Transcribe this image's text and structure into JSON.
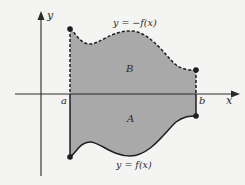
{
  "figure": {
    "axes": {
      "x_label": "x",
      "y_label": "y"
    },
    "bounds": {
      "left_label": "a",
      "right_label": "b"
    },
    "curves": {
      "upper_label": "y = −f(x)",
      "lower_label": "y = f(x)"
    },
    "regions": {
      "upper_region_label": "B",
      "lower_region_label": "A"
    },
    "colors": {
      "fill": "#a9a9a9",
      "line": "#1e1e1e",
      "background": "#f4f4f2"
    }
  }
}
